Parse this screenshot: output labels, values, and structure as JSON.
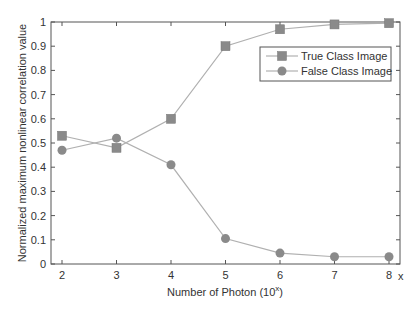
{
  "chart_data": {
    "type": "line",
    "title": "",
    "xlabel": "Number of Photon (10",
    "xlabel_superscript": "x",
    "xlabel_suffix": ")",
    "x_axis_end_label": "x",
    "ylabel": "Normalized maximum nonlinear correlation value",
    "x": [
      2,
      3,
      4,
      5,
      6,
      7,
      8
    ],
    "xlim": [
      1.8,
      8.2
    ],
    "ylim": [
      0,
      1
    ],
    "xticks": [
      "2",
      "3",
      "4",
      "5",
      "6",
      "7",
      "8"
    ],
    "yticks": [
      "0",
      "0.1",
      "0.2",
      "0.3",
      "0.4",
      "0.5",
      "0.6",
      "0.7",
      "0.8",
      "0.9",
      "1"
    ],
    "grid": false,
    "legend_position": "upper right",
    "series": [
      {
        "name": "True Class Image",
        "marker": "square",
        "color": "#8a8a8a",
        "line_color": "#b0b0b0",
        "values": [
          0.53,
          0.48,
          0.6,
          0.9,
          0.97,
          0.99,
          0.995
        ]
      },
      {
        "name": "False Class Image",
        "marker": "circle",
        "color": "#8a8a8a",
        "line_color": "#b0b0b0",
        "values": [
          0.47,
          0.52,
          0.41,
          0.105,
          0.045,
          0.03,
          0.03
        ]
      }
    ]
  }
}
